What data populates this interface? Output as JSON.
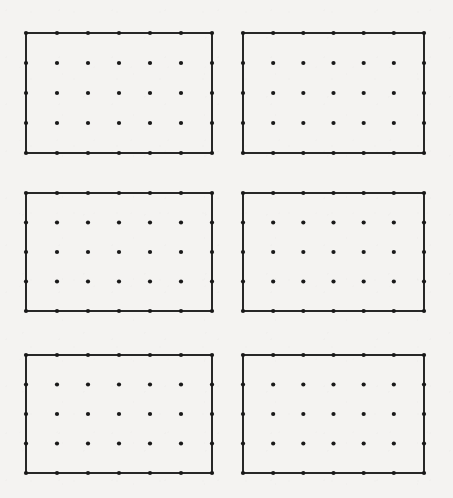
{
  "figure": {
    "background_color": "#f4f3f1",
    "width": 453,
    "height": 498,
    "panel_count": 6,
    "layout": {
      "rows": 3,
      "columns": 2
    }
  },
  "chart_data": {
    "type": "scatter",
    "title": "",
    "subtitle": "",
    "xlabel": "",
    "ylabel": "",
    "grid": false,
    "legend": null,
    "annotations": [],
    "shared": {
      "dot_color": "#191919",
      "dot_radius_px": 2.1,
      "frame_color": "#272727",
      "frame_width_px": 1.1,
      "dots_per_row": 7,
      "dots_per_column": 5,
      "dots_per_panel": 35,
      "x_values": [
        0,
        1,
        2,
        3,
        4,
        5,
        6
      ],
      "y_values": [
        0,
        1,
        2,
        3,
        4
      ],
      "xlim": [
        0,
        6
      ],
      "ylim": [
        0,
        4
      ],
      "xticks": [
        0,
        1,
        2,
        3,
        4,
        5,
        6
      ],
      "yticks": [
        0,
        1,
        2,
        3,
        4
      ],
      "xticklabels": [
        "",
        "",
        "",
        "",
        "",
        "",
        ""
      ],
      "yticklabels": [
        "",
        "",
        "",
        "",
        ""
      ]
    },
    "panels": [
      {
        "id": "panel-1",
        "position": {
          "row": 1,
          "column": 1
        },
        "label": "",
        "x_px": 26,
        "y_px": 33,
        "width_px": 186,
        "height_px": 120,
        "points": 35
      },
      {
        "id": "panel-2",
        "position": {
          "row": 1,
          "column": 2
        },
        "label": "",
        "x_px": 243,
        "y_px": 33,
        "width_px": 181,
        "height_px": 120,
        "points": 35
      },
      {
        "id": "panel-3",
        "position": {
          "row": 2,
          "column": 1
        },
        "label": "",
        "x_px": 26,
        "y_px": 193,
        "width_px": 186,
        "height_px": 118,
        "points": 35
      },
      {
        "id": "panel-4",
        "position": {
          "row": 2,
          "column": 2
        },
        "label": "",
        "x_px": 243,
        "y_px": 193,
        "width_px": 181,
        "height_px": 118,
        "points": 35
      },
      {
        "id": "panel-5",
        "position": {
          "row": 3,
          "column": 1
        },
        "label": "",
        "x_px": 26,
        "y_px": 355,
        "width_px": 186,
        "height_px": 118,
        "points": 35
      },
      {
        "id": "panel-6",
        "position": {
          "row": 3,
          "column": 2
        },
        "label": "",
        "x_px": 243,
        "y_px": 355,
        "width_px": 181,
        "height_px": 118,
        "points": 35
      }
    ]
  }
}
